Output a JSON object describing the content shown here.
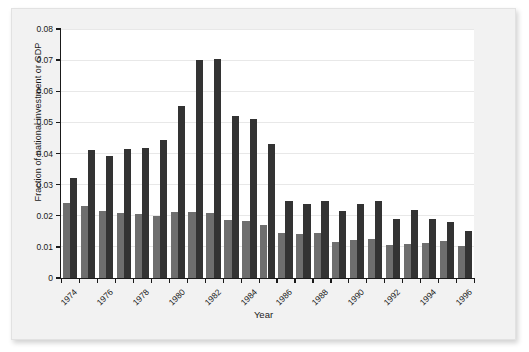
{
  "figure": {
    "xlabel": "Year",
    "ylabel": "Fraction of national investment or GDP"
  },
  "chart_data": {
    "type": "bar",
    "title": "",
    "subtitle": "",
    "xlabel": "Year",
    "ylabel": "Fraction of national investment or GDP",
    "xlim": [
      1973.5,
      1996.5
    ],
    "ylim": [
      0,
      0.08
    ],
    "grid": true,
    "legend": false,
    "legend_position": "none",
    "ytick_labels": [
      "0",
      "0.01",
      "0.02",
      "0.03",
      "0.04",
      "0.05",
      "0.06",
      "0.07",
      "0.08"
    ],
    "ytick_values": [
      0,
      0.01,
      0.02,
      0.03,
      0.04,
      0.05,
      0.06,
      0.07,
      0.08
    ],
    "xtick_labels": [
      "1974",
      "1976",
      "1978",
      "1980",
      "1982",
      "1984",
      "1986",
      "1988",
      "1990",
      "1992",
      "1994",
      "1996"
    ],
    "xtick_values": [
      1974,
      1976,
      1978,
      1980,
      1982,
      1984,
      1986,
      1988,
      1990,
      1992,
      1994,
      1996
    ],
    "categories": [
      1974,
      1975,
      1976,
      1977,
      1978,
      1979,
      1980,
      1981,
      1982,
      1983,
      1984,
      1985,
      1986,
      1987,
      1988,
      1989,
      1990,
      1991,
      1992,
      1993,
      1994,
      1995,
      1996
    ],
    "series": [
      {
        "name": "light-gray series",
        "color": "#6e6e6e",
        "values": [
          0.024,
          0.023,
          0.0215,
          0.021,
          0.0206,
          0.0199,
          0.0212,
          0.0212,
          0.021,
          0.0188,
          0.0182,
          0.017,
          0.0144,
          0.014,
          0.0145,
          0.0117,
          0.0123,
          0.0124,
          0.0107,
          0.011,
          0.0111,
          0.012,
          0.0102
        ]
      },
      {
        "name": "dark series",
        "color": "#333333",
        "values": [
          0.0322,
          0.041,
          0.0392,
          0.0414,
          0.0419,
          0.0442,
          0.0554,
          0.07,
          0.0703,
          0.0521,
          0.051,
          0.0432,
          0.0247,
          0.0237,
          0.0246,
          0.0216,
          0.0238,
          0.0248,
          0.019,
          0.022,
          0.019,
          0.0181,
          0.0151
        ]
      }
    ]
  }
}
